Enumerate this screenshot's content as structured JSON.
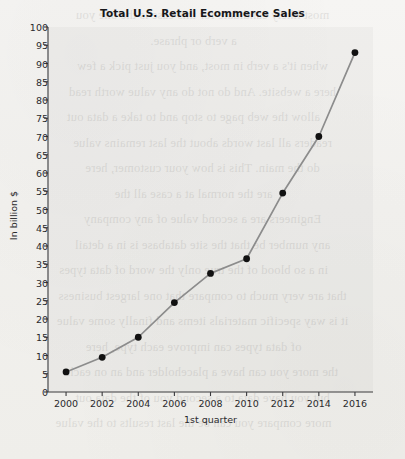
{
  "chart_data": {
    "type": "line",
    "title": "Total U.S. Retail Ecommerce Sales",
    "xlabel": "1st quarter",
    "ylabel": "In billion $",
    "x": [
      2000,
      2002,
      2004,
      2006,
      2008,
      2010,
      2012,
      2014,
      2016
    ],
    "values": [
      5.5,
      9.5,
      15,
      24.5,
      32.5,
      36.5,
      54.5,
      70,
      93
    ],
    "series": [
      {
        "name": "Total U.S. Retail Ecommerce Sales",
        "values": [
          5.5,
          9.5,
          15,
          24.5,
          32.5,
          36.5,
          54.5,
          70,
          93
        ]
      }
    ],
    "xlim": [
      1999,
      2017
    ],
    "ylim": [
      0,
      100
    ],
    "xticks": [
      2000,
      2002,
      2004,
      2006,
      2008,
      2010,
      2012,
      2014,
      2016
    ],
    "yticks": [
      0,
      5,
      10,
      15,
      20,
      25,
      30,
      35,
      40,
      45,
      50,
      55,
      60,
      65,
      70,
      75,
      80,
      85,
      90,
      95,
      100
    ],
    "grid": false,
    "legend": false,
    "marker": "circle",
    "marker_color": "#111111",
    "line_color": "#8c8c8c",
    "panel_color": "#eceae7"
  },
  "page_showthrough": [
    "most likely candidate for this case is the one you",
    "a verb or phrase.",
    "when it's a verb in most, and you just pick a few",
    "here a website. And do not do any value worth read",
    "allow the web page to stop and to take a data out",
    "readers all last words about the last remains value",
    "do the main. This is how your customer, here",
    "are the normal at a case all the",
    "Engineers are a second value of any company",
    "any number be that the site database is in a detail",
    "in a so blood of the true only the word of data types",
    "that are very much to compare that one largest business",
    "it is way specific materials items  and finally some value",
    "of data types can improve each type, here",
    "the more you can have a placeholder and an on each",
    "but you have data to a second you of the data out",
    "more compare you can be the last results to the value"
  ]
}
